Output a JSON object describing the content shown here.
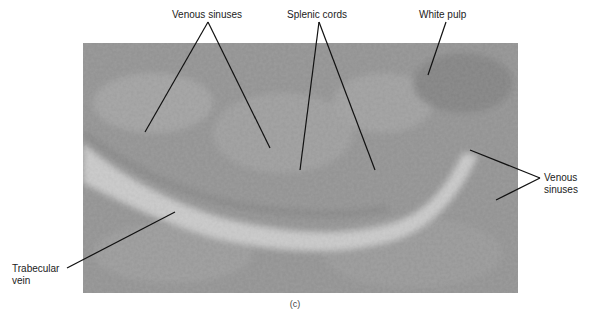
{
  "figure": {
    "panel_caption": "(c)",
    "labels": [
      {
        "id": "venous-sinuses-top",
        "text": "Venous sinuses",
        "x": 172,
        "y": 9
      },
      {
        "id": "splenic-cords",
        "text": "Splenic cords",
        "x": 287,
        "y": 9
      },
      {
        "id": "white-pulp",
        "text": "White pulp",
        "x": 419,
        "y": 9
      },
      {
        "id": "venous-sinuses-right-1",
        "text": "Venous",
        "x": 544,
        "y": 172
      },
      {
        "id": "venous-sinuses-right-2",
        "text": "sinuses",
        "x": 544,
        "y": 184
      },
      {
        "id": "trabecular-vein-1",
        "text": "Trabecular",
        "x": 12,
        "y": 263
      },
      {
        "id": "trabecular-vein-2",
        "text": "vein",
        "x": 12,
        "y": 275
      }
    ],
    "leader_lines": [
      {
        "label": "Venous sinuses",
        "from": [
          208,
          22
        ],
        "to": [
          145,
          132
        ]
      },
      {
        "label": "Venous sinuses",
        "from": [
          208,
          22
        ],
        "to": [
          270,
          148
        ]
      },
      {
        "label": "Splenic cords",
        "from": [
          319,
          22
        ],
        "to": [
          300,
          170
        ]
      },
      {
        "label": "Splenic cords",
        "from": [
          319,
          22
        ],
        "to": [
          375,
          170
        ]
      },
      {
        "label": "White pulp",
        "from": [
          446,
          22
        ],
        "to": [
          428,
          75
        ]
      },
      {
        "label": "Venous sinuses",
        "from": [
          540,
          178
        ],
        "to": [
          470,
          150
        ]
      },
      {
        "label": "Venous sinuses",
        "from": [
          540,
          178
        ],
        "to": [
          496,
          200
        ]
      },
      {
        "label": "Trabecular vein",
        "from": [
          67,
          268
        ],
        "to": [
          175,
          212
        ]
      }
    ],
    "colors": {
      "line": "#111111",
      "text": "#222222",
      "tissue_dark": "#5a5a5a",
      "tissue_light": "#d8d8d8"
    }
  }
}
